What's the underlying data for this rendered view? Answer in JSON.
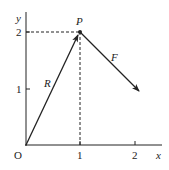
{
  "diagram": {
    "axes": {
      "x_label": "x",
      "y_label": "y",
      "origin_label": "O",
      "x_ticks": [
        "1",
        "2"
      ],
      "y_ticks": [
        "1",
        "2"
      ]
    },
    "point": {
      "label": "P",
      "x": 1,
      "y": 2
    },
    "vectors": [
      {
        "label": "R",
        "from": [
          0,
          0
        ],
        "to": [
          1,
          2
        ]
      },
      {
        "label": "F",
        "from": [
          1,
          2
        ],
        "to": [
          2.1,
          0.95
        ]
      }
    ],
    "colors": {
      "ink": "#222222",
      "background": "#ffffff"
    }
  }
}
